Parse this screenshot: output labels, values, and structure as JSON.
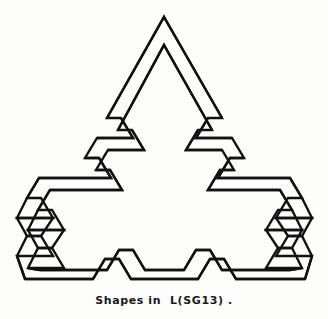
{
  "figure": {
    "caption": "Shapes in  L(SG13) .",
    "title": "Shapes in L(SG13)",
    "background_color": "#fdfdfb",
    "stroke_color": "#111111",
    "stroke_width": 2.4,
    "fill": "none",
    "viewbox": "0 0 328 290",
    "shapes": [
      {
        "name": "outer-contour",
        "stroke_color": "#111111",
        "points": "164,17 222,118 208,118 197,137 232,137 244,157 230,157 219,176 290,176 304,199 290,199 279,218 314,218 304,236 290,236 279,255 314,255 304,272 234,272 222,255 208,255 197,272 130,272 119,255 104,255 93,272 23,272 13,255 48,255 37,236 23,236 13,218 48,218 37,199 23,199 37,176 107,176 96,157 82,157 94,137 129,137 118,118 104,118"
      },
      {
        "name": "inner-contour",
        "stroke_color": "#111111",
        "points": "164,44 218,137 204,137 193,157 228,157 240,176 226,176 215,195 286,195 300,218 286,218 275,236 310,236 300,255 286,255 275,272 310,272 300,288 230,288 218,272 204,272 193,288 126,288 115,272 100,272 89,288 19,288 9,272 44,272 33,255 19,255 9,236 44,236 33,218 19,218 33,195 103,195 92,176 78,176 90,157 125,157 114,137 100,137"
      }
    ],
    "strokes": [
      {
        "name": "apex-outer-left",
        "x1": 164,
        "y1": 17,
        "x2": 104,
        "y2": 118
      },
      {
        "name": "apex-outer-right",
        "x1": 164,
        "y1": 17,
        "x2": 222,
        "y2": 118
      },
      {
        "name": "apex-inner-left",
        "x1": 164,
        "y1": 45,
        "x2": 114,
        "y2": 130
      },
      {
        "name": "apex-inner-right",
        "x1": 164,
        "y1": 45,
        "x2": 212,
        "y2": 130
      },
      {
        "name": "left-jog-upper",
        "x1": 95,
        "y1": 130,
        "x2": 140,
        "y2": 130
      },
      {
        "name": "right-jog-upper",
        "x1": 188,
        "y1": 130,
        "x2": 232,
        "y2": 130
      },
      {
        "name": "left-jog-mid",
        "x1": 55,
        "y1": 207,
        "x2": 103,
        "y2": 207
      },
      {
        "name": "right-jog-mid",
        "x1": 225,
        "y1": 207,
        "x2": 272,
        "y2": 207
      },
      {
        "name": "baseline-outer",
        "x1": 25,
        "y1": 279,
        "x2": 305,
        "y2": 279
      },
      {
        "name": "baseline-inner",
        "x1": 40,
        "y1": 270,
        "x2": 290,
        "y2": 270
      }
    ],
    "vertices": {
      "apex_outer": [
        164,
        17
      ],
      "apex_inner": [
        164,
        45
      ],
      "bottom_left_outer": [
        25,
        279
      ],
      "bottom_left_inner": [
        40,
        270
      ],
      "bottom_right_outer": [
        305,
        279
      ],
      "bottom_right_inner": [
        290,
        270
      ]
    }
  }
}
